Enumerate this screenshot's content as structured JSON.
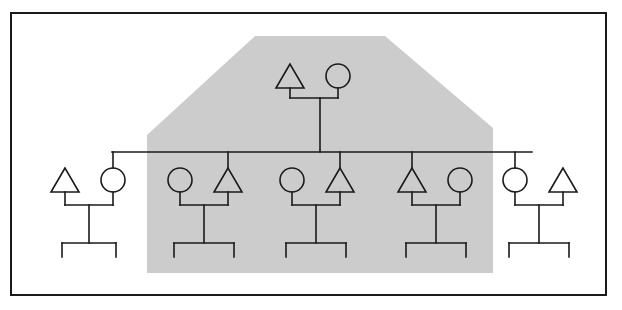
{
  "figure": {
    "type": "kinship-diagram",
    "title": "",
    "canvas": {
      "width": 622,
      "height": 310,
      "background": "#ffffff"
    },
    "colors": {
      "line": "#1a1a1a",
      "symbol_fill": "#ffffff",
      "highlight_fill": "#cccccc",
      "frame": "#1a1a1a",
      "background": "#ffffff"
    },
    "frame": {
      "x": 11,
      "y": 13,
      "width": 595,
      "height": 282,
      "stroke_width": 2
    },
    "highlight_region": {
      "name": "descent-group-shading",
      "fill": "#cccccc",
      "points": "147,135 255,36 385,36 493,128 493,273 147,273"
    },
    "symbols": {
      "male": "triangle",
      "female": "circle",
      "unspecified_child": "tick"
    },
    "generations": [
      {
        "name": "generation-1",
        "label": "",
        "nodes": [
          {
            "id": "g1-male",
            "sex": "male",
            "shape": "triangle",
            "cx": 290,
            "cy": 76,
            "in_highlight": true
          },
          {
            "id": "g1-female",
            "sex": "female",
            "shape": "circle",
            "cx": 338,
            "cy": 76,
            "in_highlight": true
          }
        ]
      },
      {
        "name": "generation-2",
        "label": "",
        "sibling_bar": {
          "x1": 112,
          "x2": 532,
          "y": 152
        },
        "couples": [
          {
            "id": "couple-1",
            "in_highlight": false,
            "left": {
              "id": "c1-male",
              "sex": "male",
              "shape": "triangle",
              "cx": 65,
              "cy": 180,
              "is_sibling": false
            },
            "right": {
              "id": "c1-female",
              "sex": "female",
              "shape": "circle",
              "cx": 113,
              "cy": 180,
              "is_sibling": true
            },
            "marriage_y": 205,
            "descent_x": 89,
            "children_bar": {
              "x1": 62,
              "x2": 116,
              "y": 243
            },
            "children_count": 2
          },
          {
            "id": "couple-2",
            "in_highlight": true,
            "left": {
              "id": "c2-female",
              "sex": "female",
              "shape": "circle",
              "cx": 180,
              "cy": 180,
              "is_sibling": false
            },
            "right": {
              "id": "c2-male",
              "sex": "male",
              "shape": "triangle",
              "cx": 228,
              "cy": 180,
              "is_sibling": true
            },
            "marriage_y": 205,
            "descent_x": 204,
            "children_bar": {
              "x1": 174,
              "x2": 234,
              "y": 243
            },
            "children_count": 2
          },
          {
            "id": "couple-3",
            "in_highlight": true,
            "left": {
              "id": "c3-female",
              "sex": "female",
              "shape": "circle",
              "cx": 292,
              "cy": 180,
              "is_sibling": false
            },
            "right": {
              "id": "c3-male",
              "sex": "male",
              "shape": "triangle",
              "cx": 340,
              "cy": 180,
              "is_sibling": true
            },
            "marriage_y": 205,
            "descent_x": 316,
            "children_bar": {
              "x1": 286,
              "x2": 346,
              "y": 243
            },
            "children_count": 2
          },
          {
            "id": "couple-4",
            "in_highlight": true,
            "left": {
              "id": "c4-male",
              "sex": "male",
              "shape": "triangle",
              "cx": 412,
              "cy": 180,
              "is_sibling": true
            },
            "right": {
              "id": "c4-female",
              "sex": "female",
              "shape": "circle",
              "cx": 460,
              "cy": 180,
              "is_sibling": false
            },
            "marriage_y": 205,
            "descent_x": 436,
            "children_bar": {
              "x1": 406,
              "x2": 466,
              "y": 243
            },
            "children_count": 2
          },
          {
            "id": "couple-5",
            "in_highlight": false,
            "left": {
              "id": "c5-female",
              "sex": "female",
              "shape": "circle",
              "cx": 515,
              "cy": 180,
              "is_sibling": true
            },
            "right": {
              "id": "c5-male",
              "sex": "male",
              "shape": "triangle",
              "cx": 563,
              "cy": 180,
              "is_sibling": false
            },
            "marriage_y": 205,
            "descent_x": 539,
            "children_bar": {
              "x1": 509,
              "x2": 569,
              "y": 243
            },
            "children_count": 2
          }
        ]
      }
    ],
    "links": {
      "apex_marriage_bar": {
        "x1": 290,
        "x2": 338,
        "y": 98
      },
      "apex_descent": {
        "x": 320,
        "y1": 98,
        "y2": 152
      },
      "sibling_drops": [
        112,
        228,
        340,
        412,
        515
      ]
    },
    "geometry": {
      "triangle_width": 28,
      "triangle_height": 24,
      "circle_radius": 12,
      "stroke_width": 1.6,
      "child_tick_height": 14
    }
  }
}
